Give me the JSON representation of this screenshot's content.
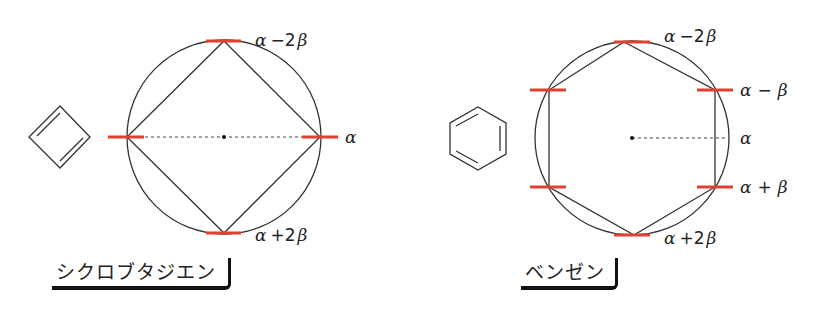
{
  "colors": {
    "energy_level": "#e0412f",
    "lines": "#333333",
    "text": "#222222"
  },
  "diagrams": [
    {
      "name": "シクロブタジエン",
      "molecule": "cyclobutadiene",
      "polygon": "square",
      "levels": [
        {
          "label_base": "α",
          "label_op": "−2",
          "label_beta": "β"
        },
        {
          "label_base": "α",
          "label_op": "",
          "label_beta": ""
        },
        {
          "label_base": "α",
          "label_op": "+2",
          "label_beta": "β"
        }
      ]
    },
    {
      "name": "ベンゼン",
      "molecule": "benzene",
      "polygon": "hexagon",
      "levels": [
        {
          "label_base": "α",
          "label_op": "−2",
          "label_beta": "β"
        },
        {
          "label_base": "α",
          "label_op": "−",
          "label_beta": "β"
        },
        {
          "label_base": "α",
          "label_op": "",
          "label_beta": ""
        },
        {
          "label_base": "α",
          "label_op": "+",
          "label_beta": "β"
        },
        {
          "label_base": "α",
          "label_op": "+2",
          "label_beta": "β"
        }
      ]
    }
  ]
}
